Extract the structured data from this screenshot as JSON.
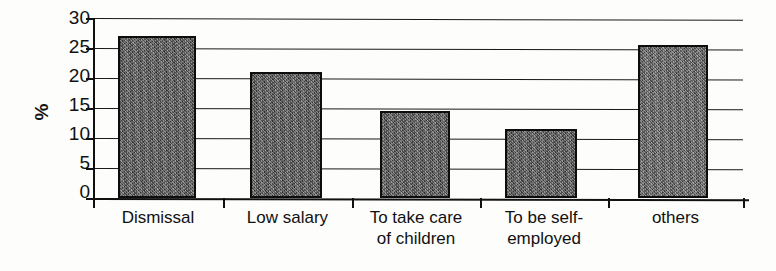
{
  "chart_data": {
    "type": "bar",
    "title": "",
    "subtitle": "",
    "xlabel": "",
    "ylabel": "%",
    "ylim": [
      0,
      30
    ],
    "y_ticks": [
      0,
      5,
      10,
      15,
      20,
      25,
      30
    ],
    "grid": true,
    "legend": "none",
    "categories": [
      "Dismissal",
      "Low salary",
      "To take care of children",
      "To be self-employed",
      "others"
    ],
    "category_lines": [
      [
        "Dismissal",
        ""
      ],
      [
        "Low salary",
        ""
      ],
      [
        "To take care",
        "of children"
      ],
      [
        "To be self-",
        "employed"
      ],
      [
        "others",
        ""
      ]
    ],
    "values": [
      27,
      21,
      14.5,
      11.5,
      25.5
    ],
    "bar_color": "#5d5d5d",
    "bar_border_color": "#0d0d0d",
    "axis_color": "#111111",
    "background_color": "#fdfdfc"
  }
}
